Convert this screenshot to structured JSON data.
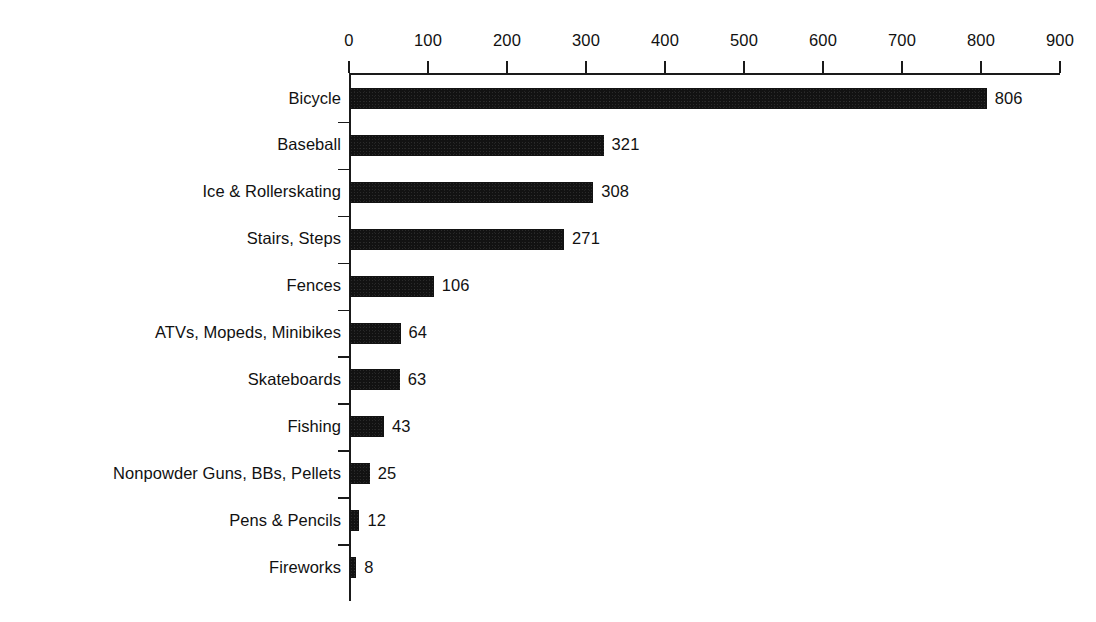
{
  "chart_data": {
    "type": "bar",
    "orientation": "horizontal",
    "title": "",
    "subtitle": "",
    "xlabel": "",
    "ylabel": "",
    "xlim": [
      0,
      900
    ],
    "xticks": [
      0,
      100,
      200,
      300,
      400,
      500,
      600,
      700,
      800,
      900
    ],
    "xtick_labels": [
      "0",
      "100",
      "200",
      "300",
      "400",
      "500",
      "600",
      "700",
      "800",
      "900"
    ],
    "grid": false,
    "legend": null,
    "bar_color": "#121212",
    "axis_color": "#1a1a1a",
    "text_color": "#111111",
    "background_color": "#ffffff",
    "categories": [
      "Bicycle",
      "Baseball",
      "Ice & Rollerskating",
      "Stairs, Steps",
      "Fences",
      "ATVs, Mopeds, Minibikes",
      "Skateboards",
      "Fishing",
      "Nonpowder Guns, BBs, Pellets",
      "Pens & Pencils",
      "Fireworks"
    ],
    "values": [
      806,
      321,
      308,
      271,
      106,
      64,
      63,
      43,
      25,
      12,
      8
    ],
    "value_labels": [
      "806",
      "321",
      "308",
      "271",
      "106",
      "64",
      "63",
      "43",
      "25",
      "12",
      "8"
    ]
  }
}
